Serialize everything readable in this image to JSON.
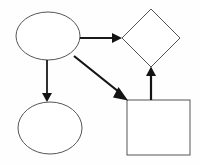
{
  "diagram": {
    "type": "flowchart",
    "canvas": {
      "width": 201,
      "height": 164,
      "background": "#fefefe"
    },
    "style": {
      "node_stroke": "#555555",
      "node_fill": "#ffffff",
      "node_stroke_width": 1,
      "edge_stroke": "#1a1a1a",
      "edge_stroke_width": 2,
      "thin_edge_stroke_width": 1.6
    },
    "nodes": [
      {
        "id": "node-ellipse-top",
        "name": "ellipse-top-left",
        "shape": "ellipse",
        "label": "",
        "cx": 48,
        "cy": 36,
        "rx": 32,
        "ry": 24
      },
      {
        "id": "node-ellipse-bottom",
        "name": "ellipse-bottom-left",
        "shape": "ellipse",
        "label": "",
        "cx": 50,
        "cy": 128,
        "rx": 32,
        "ry": 26
      },
      {
        "id": "node-diamond",
        "name": "diamond-top-right",
        "shape": "diamond",
        "label": "",
        "cx": 151,
        "cy": 38,
        "rx": 29,
        "ry": 29,
        "points": "151,9 180,38 151,67 122,38"
      },
      {
        "id": "node-square",
        "name": "square-bottom-right",
        "shape": "rectangle",
        "label": "",
        "x": 127,
        "y": 100,
        "width": 63,
        "height": 55
      }
    ],
    "edges": [
      {
        "id": "edge-ellipse-to-diamond",
        "name": "arrow-ellipse-top-to-diamond",
        "from": "node-ellipse-top",
        "to": "node-diamond",
        "direction": "horizontal-right",
        "label": "",
        "x1": 80,
        "y1": 38,
        "x2": 121,
        "y2": 38,
        "head": "113,33.5 122,38 113,42.5",
        "width": 1.8
      },
      {
        "id": "edge-ellipse-to-ellipse",
        "name": "arrow-ellipse-top-to-ellipse-bottom",
        "from": "node-ellipse-top",
        "to": "node-ellipse-bottom",
        "direction": "vertical-down",
        "label": "",
        "x1": 47,
        "y1": 60,
        "x2": 47,
        "y2": 93,
        "head": "42.5,93 51.5,93 47,102",
        "width": 1.8
      },
      {
        "id": "edge-ellipse-to-square",
        "name": "arrow-ellipse-top-to-square",
        "from": "node-ellipse-top",
        "to": "node-square",
        "direction": "diagonal-down-right",
        "label": "",
        "x1": 74,
        "y1": 56,
        "x2": 122,
        "y2": 94,
        "head": "117.5,90.5 127,100 114.5,99",
        "width": 2.2
      },
      {
        "id": "edge-square-to-diamond",
        "name": "arrow-square-to-diamond",
        "from": "node-square",
        "to": "node-diamond",
        "direction": "vertical-up",
        "label": "",
        "x1": 151,
        "y1": 100,
        "x2": 151,
        "y2": 75,
        "head": "146.5,75 155.5,75 151,67",
        "width": 2.2
      }
    ]
  }
}
